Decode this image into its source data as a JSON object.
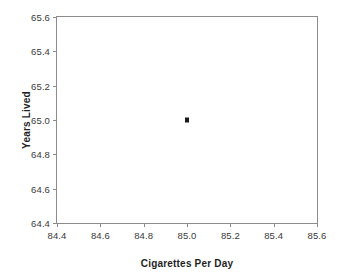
{
  "chart_data": {
    "type": "scatter",
    "title": "",
    "xlabel": "Cigarettes Per Day",
    "ylabel": "Years Lived",
    "xlim": [
      84.4,
      85.6
    ],
    "ylim": [
      64.4,
      65.6
    ],
    "xticks": [
      84.4,
      84.6,
      84.8,
      85.0,
      85.2,
      85.4,
      85.6
    ],
    "yticks": [
      64.4,
      64.6,
      64.8,
      65.0,
      65.2,
      65.4,
      65.6
    ],
    "xtick_labels": [
      "84.4",
      "84.6",
      "84.8",
      "85.0",
      "85.2",
      "85.4",
      "85.6"
    ],
    "ytick_labels": [
      "64.4",
      "64.6",
      "64.8",
      "65.0",
      "65.2",
      "65.4",
      "65.6"
    ],
    "grid": false,
    "legend": false,
    "series": [
      {
        "name": "data",
        "marker": "square",
        "color": "#1a1a1a",
        "points": [
          {
            "x": 85.0,
            "y": 65.0
          }
        ]
      }
    ],
    "x": [
      85.0
    ],
    "values": [
      65.0
    ],
    "colors": {
      "axis": "#8c8c8c",
      "tick_text": "#3a3a3a",
      "title_text": "#1f1f1f",
      "marker": "#1a1a1a",
      "background": "#ffffff"
    }
  }
}
